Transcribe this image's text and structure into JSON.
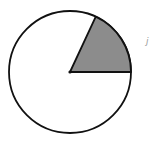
{
  "figure": {
    "type": "circle-sector",
    "circle": {
      "cx": 70,
      "cy": 72,
      "r": 61
    },
    "sector": {
      "start_angle_deg": 0,
      "end_angle_deg": 65,
      "fill": "#8c8c8c"
    },
    "stroke": "#111111",
    "background": "#ffffff",
    "stray_mark": "j"
  }
}
